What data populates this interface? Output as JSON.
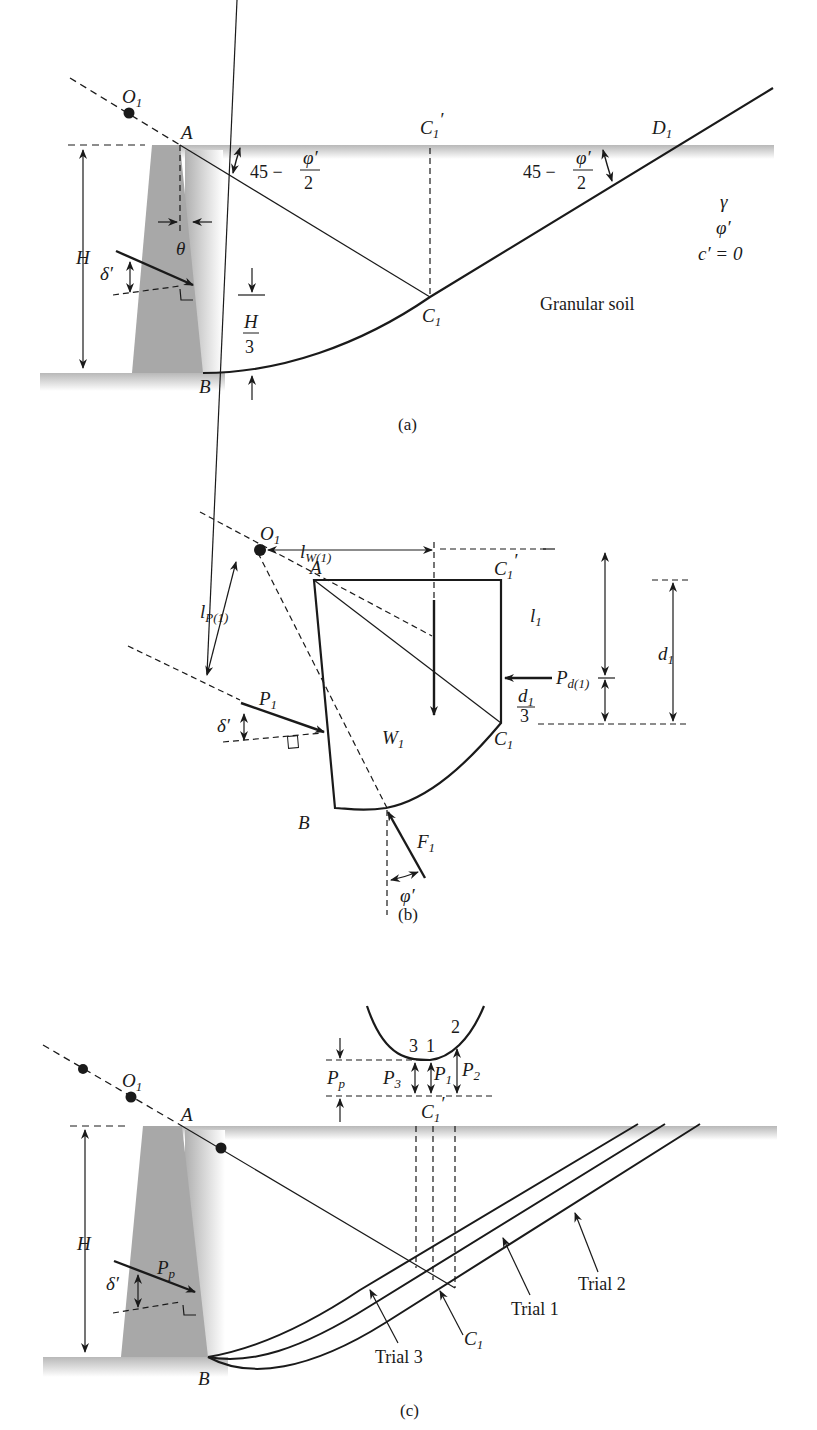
{
  "figure": {
    "panels": [
      {
        "id": "a",
        "caption": "(a)",
        "points": {
          "O1": "O",
          "A": "A",
          "B": "B",
          "C1": "C",
          "C1p": "C",
          "D1": "D"
        },
        "angle_label": {
          "num": "45 − ",
          "phi": "φ′",
          "den": "2"
        },
        "theta": "θ",
        "delta": "δ′",
        "H": "H",
        "H3_num": "H",
        "H3_den": "3",
        "soil": {
          "gamma": "γ",
          "phi": "φ′",
          "c": "c′ = 0",
          "name": "Granular soil"
        },
        "sub1": "1",
        "prime": "′"
      },
      {
        "id": "b",
        "caption": "(b)",
        "labels": {
          "O": "O",
          "A": "A",
          "B": "B",
          "C": "C",
          "lW": "l",
          "lW_sub": "W(1)",
          "lP": "l",
          "lP_sub": "P(1)",
          "P1": "P",
          "W1": "W",
          "F1": "F",
          "l1": "l",
          "d1": "d",
          "Pd": "P",
          "Pd_sub": "d(1)",
          "d13_num": "d",
          "d13_den": "3",
          "delta": "δ′",
          "phi": "φ′",
          "one": "1",
          "prime": "′"
        }
      },
      {
        "id": "c",
        "caption": "(c)",
        "labels": {
          "O": "O",
          "A": "A",
          "B": "B",
          "C": "C",
          "H": "H",
          "delta": "δ′",
          "Pp": "P",
          "Pp_sub": "p",
          "P1": "P",
          "P2": "P",
          "P3": "P",
          "n1": "1",
          "n2": "2",
          "n3": "3",
          "one": "1",
          "prime": "′",
          "trial1": "Trial 1",
          "trial2": "Trial 2",
          "trial3": "Trial 3"
        }
      }
    ]
  }
}
